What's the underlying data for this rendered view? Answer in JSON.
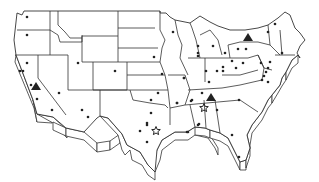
{
  "map": {
    "title": "United States",
    "style": "3D extruded outline map",
    "colors": {
      "land": "#ffffff",
      "border": "#333333",
      "marker": "#222222"
    },
    "legend": [
      {
        "symbol": "dot",
        "meaning": "location"
      },
      {
        "symbol": "triangle",
        "meaning": "location"
      },
      {
        "symbol": "star",
        "meaning": "location"
      }
    ],
    "markers": {
      "dots": [
        [
          27,
          17
        ],
        [
          27,
          35
        ],
        [
          27,
          63
        ],
        [
          20,
          71
        ],
        [
          23,
          71
        ],
        [
          31,
          85
        ],
        [
          37,
          99
        ],
        [
          59,
          93
        ],
        [
          52,
          110
        ],
        [
          78,
          63
        ],
        [
          82,
          110
        ],
        [
          88,
          117
        ],
        [
          115,
          71
        ],
        [
          154,
          57
        ],
        [
          162,
          74
        ],
        [
          184,
          78
        ],
        [
          158,
          93
        ],
        [
          151,
          100
        ],
        [
          177,
          103
        ],
        [
          191,
          101
        ],
        [
          151,
          113
        ],
        [
          147,
          125
        ],
        [
          198,
          125
        ],
        [
          173,
          32
        ],
        [
          198,
          46
        ],
        [
          213,
          46
        ],
        [
          225,
          53
        ],
        [
          238,
          49
        ],
        [
          246,
          49
        ],
        [
          268,
          32
        ],
        [
          275,
          24
        ],
        [
          232,
          61
        ],
        [
          223,
          67
        ],
        [
          223,
          71
        ],
        [
          217,
          71
        ],
        [
          206,
          71
        ],
        [
          236,
          68
        ],
        [
          243,
          63
        ],
        [
          261,
          63
        ],
        [
          209,
          82
        ],
        [
          184,
          78
        ],
        [
          198,
          53
        ],
        [
          282,
          53
        ],
        [
          270,
          62
        ],
        [
          198,
          56
        ],
        [
          177,
          103
        ],
        [
          192,
          100
        ],
        [
          202,
          93
        ],
        [
          239,
          100
        ],
        [
          217,
          110
        ],
        [
          199,
          124
        ],
        [
          188,
          132
        ],
        [
          232,
          135
        ],
        [
          239,
          157
        ],
        [
          147,
          123
        ],
        [
          140,
          131
        ],
        [
          147,
          142
        ],
        [
          187,
          132
        ],
        [
          268,
          68
        ],
        [
          266,
          72
        ],
        [
          264,
          76
        ],
        [
          262,
          80
        ],
        [
          268,
          82
        ]
      ],
      "triangles": [
        [
          36,
          87
        ],
        [
          248,
          38
        ],
        [
          211,
          98
        ]
      ],
      "stars": [
        [
          156,
          131
        ],
        [
          204,
          108
        ]
      ]
    }
  }
}
